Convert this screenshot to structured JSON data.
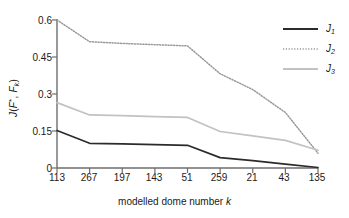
{
  "chart_data": {
    "type": "line",
    "title": "",
    "xlabel": "modelled dome number k",
    "ylabel": "J(F*, Fk)",
    "categories": [
      "113",
      "267",
      "197",
      "143",
      "51",
      "259",
      "21",
      "43",
      "135"
    ],
    "ylim": [
      0,
      0.6
    ],
    "yticks": [
      "0",
      "0.15",
      "0.3",
      "0.45",
      "0.6"
    ],
    "ytick_values": [
      0,
      0.15,
      0.3,
      0.45,
      0.6
    ],
    "grid": false,
    "legend_position": "top-right",
    "series": [
      {
        "name": "J1",
        "label_base": "J",
        "label_sub": "1",
        "style": "solid",
        "color": "#2b2b2b",
        "width": 1.7,
        "values": [
          0.152,
          0.1,
          0.098,
          0.095,
          0.092,
          0.042,
          0.03,
          0.016,
          0.002
        ]
      },
      {
        "name": "J2",
        "label_base": "J",
        "label_sub": "2",
        "style": "dotted",
        "color": "#9a9a9a",
        "width": 1.5,
        "values": [
          0.6,
          0.512,
          0.505,
          0.5,
          0.495,
          0.382,
          0.318,
          0.225,
          0.06
        ]
      },
      {
        "name": "J3",
        "label_base": "J",
        "label_sub": "3",
        "style": "solid",
        "color": "#c2c2c2",
        "width": 1.7,
        "values": [
          0.265,
          0.215,
          0.212,
          0.208,
          0.205,
          0.148,
          0.13,
          0.112,
          0.072
        ]
      }
    ]
  },
  "axes": {
    "y_label_prefix": "J(",
    "y_label_fstar": "F",
    "y_label_star": "*",
    "y_label_mid": ", ",
    "y_label_fk": "F",
    "y_label_k": "k",
    "y_label_suffix": ")",
    "x_label_text": "modelled dome number ",
    "x_label_italic": "k"
  },
  "colors": {
    "axis": "#6e6e6e",
    "text": "#1a1a1a",
    "background": "#ffffff"
  }
}
